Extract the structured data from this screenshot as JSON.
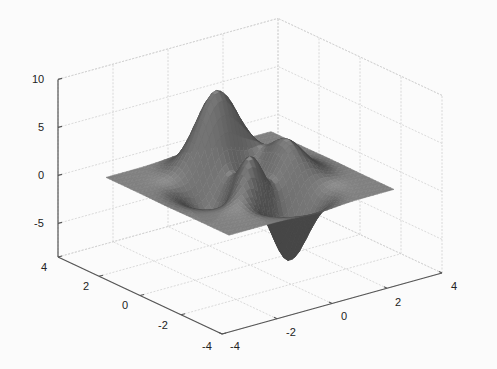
{
  "chart_data": {
    "type": "surface",
    "function": "peaks",
    "title": "",
    "xlabel": "",
    "ylabel": "",
    "zlabel": "",
    "x_range": [
      -3,
      3
    ],
    "y_range": [
      -3,
      3
    ],
    "xlim": [
      -4,
      4
    ],
    "ylim": [
      -4,
      4
    ],
    "zlim": [
      -8.5,
      10
    ],
    "x_ticks": [
      "-4",
      "-2",
      "0",
      "2",
      "4"
    ],
    "y_ticks": [
      "4",
      "2",
      "0",
      "-2",
      "-4"
    ],
    "z_ticks": [
      "10",
      "5",
      "0",
      "-5"
    ],
    "grid": true,
    "colormap": "gray (flat shaded)",
    "features": {
      "max_peak": {
        "x": 0,
        "y": 1.6,
        "z": 8.1
      },
      "min_trough": {
        "x": 0.2,
        "y": -1.6,
        "z": -6.5
      },
      "secondary_peaks": [
        {
          "x": -1.3,
          "y": 0,
          "z": 3.8
        },
        {
          "x": 1.3,
          "y": 0.2,
          "z": 3.6
        }
      ]
    }
  },
  "colors": {
    "surface_base": "#7a7a7a",
    "axis_line": "#555555",
    "grid_line": "#d0d0d0",
    "background": "#fbfbfb"
  }
}
